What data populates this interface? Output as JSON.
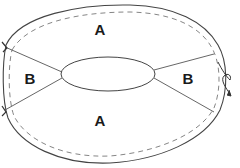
{
  "diagram": {
    "type": "annular-region-sketch",
    "labels": [
      {
        "id": "region-top",
        "text": "A",
        "x": 100,
        "y": 29
      },
      {
        "id": "region-bottom",
        "text": "A",
        "x": 100,
        "y": 120
      },
      {
        "id": "region-left",
        "text": "B",
        "x": 30,
        "y": 78
      },
      {
        "id": "region-right",
        "text": "B",
        "x": 188,
        "y": 78
      }
    ],
    "colors": {
      "stroke": "#444444",
      "dashed": "#666666",
      "label": "#1a1a1a",
      "background": "#ffffff"
    }
  }
}
